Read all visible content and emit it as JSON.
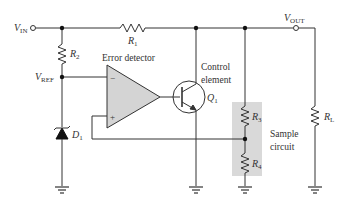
{
  "labels": {
    "vin_main": "V",
    "vin_sub": "IN",
    "vout_main": "V",
    "vout_sub": "OUT",
    "vref_main": "V",
    "vref_sub": "REF",
    "r1_main": "R",
    "r1_sub": "1",
    "r2_main": "R",
    "r2_sub": "2",
    "r3_main": "R",
    "r3_sub": "3",
    "r4_main": "R",
    "r4_sub": "4",
    "rl_main": "R",
    "rl_sub": "L",
    "d1_main": "D",
    "d1_sub": "1",
    "q1_main": "Q",
    "q1_sub": "1",
    "error_detector": "Error detector",
    "control_line1": "Control",
    "control_line2": "element",
    "sample_line1": "Sample",
    "sample_line2": "circuit",
    "opamp_minus": "−",
    "opamp_plus": "+"
  },
  "colors": {
    "wire": "#333333",
    "opamp_fill": "#d4d4d4",
    "sample_box": "#d9d9d9",
    "text": "#333333"
  }
}
